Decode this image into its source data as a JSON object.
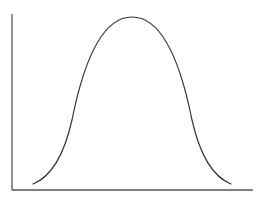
{
  "diagram": {
    "type": "bell-curve",
    "colors": {
      "background": "#ffffff",
      "curve": "#333333",
      "axes": "#555555"
    },
    "axes": {
      "origin": [
        12,
        190
      ],
      "y_axis_top": [
        12,
        14
      ],
      "x_axis_end": [
        253,
        190
      ],
      "xlabel": "",
      "ylabel": ""
    },
    "curve": {
      "start": [
        33,
        184
      ],
      "peak": [
        132,
        17
      ],
      "end": [
        231,
        184
      ],
      "path": "M33,184 C48,178 63,160 72,120 C82,70 100,17 132,17 C164,17 182,70 192,120 C201,160 216,178 231,184"
    }
  }
}
